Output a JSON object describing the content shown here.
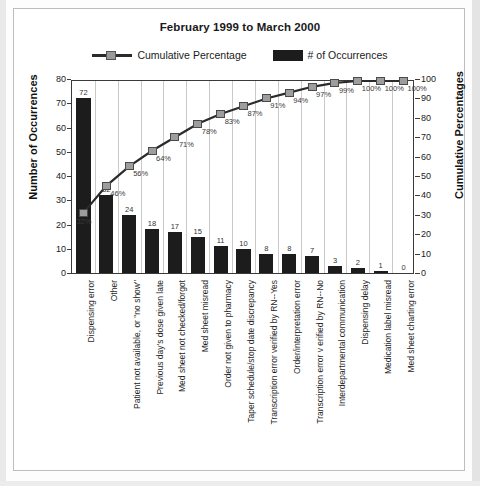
{
  "title": "February 1999 to March 2000",
  "legend": [
    {
      "label": "Cumulative Percentage",
      "marker": "line-square-marker",
      "color": "#9d9d9d"
    },
    {
      "label": "# of Occurrences",
      "marker": "filled-rect-swatch",
      "color": "#1c1c1c"
    }
  ],
  "axes": {
    "left_title": "Number of Occurrences",
    "right_title": "Cumulative Percentages",
    "left_ticks": [
      "0",
      "10",
      "20",
      "30",
      "40",
      "50",
      "60",
      "70",
      "80"
    ],
    "right_ticks": [
      "0",
      "10",
      "20",
      "30",
      "40",
      "50",
      "60",
      "70",
      "80",
      "90",
      "100"
    ]
  },
  "chart_data": {
    "type": "bar",
    "title": "February 1999 to March 2000",
    "xlabel": "",
    "ylabel": "Number of Occurrences",
    "y2label": "Cumulative Percentages",
    "ylim": [
      0,
      80
    ],
    "y2lim": [
      0,
      100
    ],
    "grid": true,
    "legend_position": "top",
    "categories": [
      "Dispensing error",
      "Other",
      "Patient not available, or \"no show\"",
      "Previous day's dose given late",
      "Med sheet not checked/forgot",
      "Med sheet misread",
      "Order not given to pharmacy",
      "Taper schedule/stop date discrepancy",
      "Transcription error verified by RN--Yes",
      "Order/interpretation error",
      "Transcription error v erified by RN--No",
      "Interdepartmental communication",
      "Dispensing delay",
      "Medication label misread",
      "Med sheet charting error"
    ],
    "series": [
      {
        "name": "# of Occurrences",
        "type": "bar",
        "axis": "left",
        "values": [
          72,
          32,
          24,
          18,
          17,
          15,
          11,
          10,
          8,
          8,
          7,
          3,
          2,
          1,
          0
        ],
        "labels": [
          "72",
          "32",
          "24",
          "18",
          "17",
          "15",
          "11",
          "10",
          "8",
          "8",
          "7",
          "3",
          "2",
          "1",
          "0"
        ]
      },
      {
        "name": "Cumulative Percentage",
        "type": "line",
        "axis": "right",
        "values": [
          32,
          46,
          56,
          64,
          71,
          78,
          83,
          87,
          91,
          94,
          97,
          99,
          100,
          100,
          100
        ],
        "labels": [
          "32%",
          "46%",
          "56%",
          "64%",
          "71%",
          "78%",
          "83%",
          "87%",
          "91%",
          "94%",
          "97%",
          "99%",
          "100%",
          "100%",
          "100%"
        ]
      }
    ]
  }
}
